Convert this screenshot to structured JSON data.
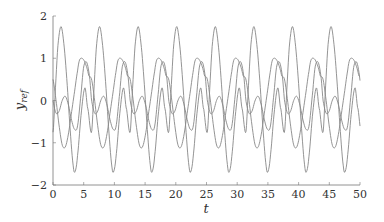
{
  "chart_data": {
    "type": "line",
    "title": "",
    "xlabel": "t",
    "ylabel": "y_ref",
    "xlim": [
      0,
      50
    ],
    "ylim": [
      -2,
      2
    ],
    "xticks": [
      0,
      5,
      10,
      15,
      20,
      25,
      30,
      35,
      40,
      45,
      50
    ],
    "yticks": [
      -2,
      -1,
      0,
      1,
      2
    ],
    "grid": false,
    "legend": null,
    "period": 6.2832,
    "series": [
      {
        "name": "y_ref,1",
        "color": "#888888",
        "one_period_t": [
          0,
          0.4,
          0.8,
          1.3,
          1.8,
          2.3,
          2.8,
          3.3,
          3.6,
          4.0,
          4.6,
          5.2,
          5.7,
          6.2832
        ],
        "one_period_y": [
          -0.75,
          0.3,
          1.3,
          1.75,
          1.3,
          0.4,
          -0.7,
          -1.55,
          -1.68,
          -1.3,
          -0.3,
          0.3,
          -0.2,
          -0.75
        ]
      },
      {
        "name": "y_ref,2",
        "color": "#888888",
        "one_period_t": [
          0,
          0.5,
          1.0,
          1.5,
          2.0,
          2.5,
          3.0,
          3.5,
          4.0,
          4.6,
          5.0,
          5.5,
          6.0,
          6.2832
        ],
        "one_period_y": [
          0.0,
          -0.3,
          -0.25,
          0.0,
          0.1,
          -0.1,
          -0.45,
          -0.68,
          -0.6,
          0.2,
          0.8,
          0.9,
          0.5,
          0.0
        ]
      },
      {
        "name": "y_ref,3",
        "color": "#888888",
        "one_period_t": [
          0,
          0.5,
          1.0,
          1.5,
          2.0,
          2.5,
          3.0,
          3.5,
          4.0,
          4.3,
          4.7,
          5.2,
          5.8,
          6.2832
        ],
        "one_period_y": [
          0.5,
          0.0,
          -0.6,
          -1.05,
          -1.1,
          -0.8,
          -0.3,
          0.2,
          0.7,
          0.95,
          1.0,
          0.9,
          0.6,
          0.5
        ]
      }
    ]
  }
}
